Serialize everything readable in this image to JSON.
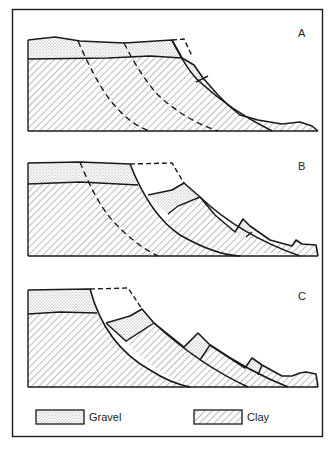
{
  "figure": {
    "panels": [
      {
        "id": "A",
        "label": "A",
        "description": "Initial slope with gravel cap over clay; dashed potential failure surfaces"
      },
      {
        "id": "B",
        "label": "B",
        "description": "First rotational slump; block moved down slope, original profile dashed"
      },
      {
        "id": "C",
        "label": "C",
        "description": "Successive rotational slumps forming stepped blocks"
      }
    ],
    "legend": {
      "items": [
        {
          "key": "gravel",
          "label": "Gravel",
          "pattern": "stipple"
        },
        {
          "key": "clay",
          "label": "Clay",
          "pattern": "diagonal-hatch"
        }
      ]
    },
    "colors": {
      "line": "#1a1a1a",
      "background": "#ffffff",
      "stipple": "#8a8a8a",
      "hatch": "#555555"
    }
  }
}
